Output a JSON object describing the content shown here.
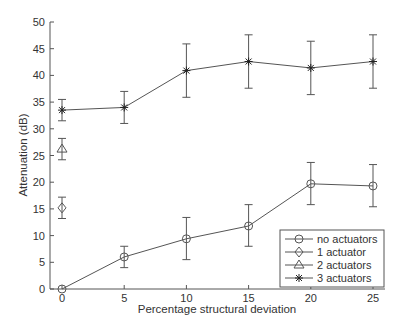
{
  "chart_data": {
    "type": "line",
    "title": "",
    "xlabel": "Percentage structural deviation",
    "ylabel": "Attenuation (dB)",
    "xlim": [
      0,
      25
    ],
    "ylim": [
      0,
      50
    ],
    "x_ticks": [
      0,
      5,
      10,
      15,
      20,
      25
    ],
    "y_ticks": [
      0,
      5,
      10,
      15,
      20,
      25,
      30,
      35,
      40,
      45,
      50
    ],
    "grid": false,
    "legend_position": "lower right",
    "series": [
      {
        "name": "no actuators",
        "marker": "circle",
        "x": [
          0,
          5,
          10,
          15,
          20,
          25
        ],
        "values": [
          0,
          6,
          9.4,
          11.8,
          19.7,
          19.3
        ],
        "err_low": [
          0,
          4,
          5.5,
          8,
          15.8,
          15.4
        ],
        "err_high": [
          0,
          8,
          13.4,
          15.8,
          23.7,
          23.3
        ]
      },
      {
        "name": "1 actuator",
        "marker": "diamond",
        "x": [
          0
        ],
        "values": [
          15.2
        ],
        "err_low": [
          13.2
        ],
        "err_high": [
          17.2
        ]
      },
      {
        "name": "2 actuators",
        "marker": "triangle",
        "x": [
          0
        ],
        "values": [
          26.2
        ],
        "err_low": [
          24.2
        ],
        "err_high": [
          28.2
        ]
      },
      {
        "name": "3 actuators",
        "marker": "star",
        "x": [
          0,
          5,
          10,
          15,
          20,
          25
        ],
        "values": [
          33.5,
          34,
          40.9,
          42.6,
          41.4,
          42.6
        ],
        "err_low": [
          31.5,
          31,
          35.9,
          37.6,
          36.4,
          37.6
        ],
        "err_high": [
          35.5,
          37,
          45.9,
          47.6,
          46.4,
          47.6
        ]
      }
    ]
  }
}
